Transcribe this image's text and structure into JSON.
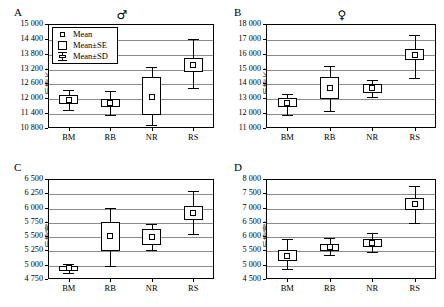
{
  "figure": {
    "panels": [
      "A",
      "B",
      "C",
      "D"
    ],
    "legend": {
      "mean_label": "Mean",
      "se_label": "Mean±SE",
      "sd_label": "Mean±SD"
    }
  },
  "chart_data": [
    {
      "panel": "A",
      "type": "box",
      "title": "A",
      "sex_symbol": "♂",
      "ylabel": "后翅长/mm",
      "xlabel": "",
      "categories": [
        "BM",
        "RB",
        "NR",
        "RS"
      ],
      "ylim": [
        10800,
        15000
      ],
      "yticks": [
        "10 800",
        "11 400",
        "12 000",
        "12 600",
        "13 200",
        "13 800",
        "14 400",
        "15 000"
      ],
      "ytick_values": [
        10800,
        11400,
        12000,
        12600,
        13200,
        13800,
        14400,
        15000
      ],
      "grid": true,
      "legend_position": "upper-left",
      "series": [
        {
          "name": "BM",
          "mean": 11930,
          "se_low": 11760,
          "se_high": 12120,
          "sd_low": 11530,
          "sd_high": 12330
        },
        {
          "name": "RB",
          "mean": 11800,
          "se_low": 11650,
          "se_high": 11960,
          "sd_low": 11330,
          "sd_high": 12280
        },
        {
          "name": "NR",
          "mean": 12070,
          "se_low": 11330,
          "se_high": 12840,
          "sd_low": 10910,
          "sd_high": 13270
        },
        {
          "name": "RS",
          "mean": 13360,
          "se_low": 13080,
          "se_high": 13640,
          "sd_low": 12400,
          "sd_high": 14400
        }
      ]
    },
    {
      "panel": "B",
      "type": "box",
      "title": "B",
      "sex_symbol": "♀",
      "ylabel": "后翅长/mm",
      "xlabel": "",
      "categories": [
        "BM",
        "RB",
        "NR",
        "RS"
      ],
      "ylim": [
        11000,
        18000
      ],
      "yticks": [
        "11 000",
        "12 000",
        "13 000",
        "14 000",
        "15 000",
        "16 000",
        "17 000",
        "18 000"
      ],
      "ytick_values": [
        11000,
        12000,
        13000,
        14000,
        15000,
        16000,
        17000,
        18000
      ],
      "grid": true,
      "legend_position": "none",
      "series": [
        {
          "name": "BM",
          "mean": 12700,
          "se_low": 12400,
          "se_high": 13000,
          "sd_low": 11900,
          "sd_high": 13300
        },
        {
          "name": "RB",
          "mean": 13680,
          "se_low": 12950,
          "se_high": 14450,
          "sd_low": 12130,
          "sd_high": 15200
        },
        {
          "name": "NR",
          "mean": 13660,
          "se_low": 13350,
          "se_high": 13950,
          "sd_low": 13100,
          "sd_high": 14200
        },
        {
          "name": "RS",
          "mean": 15930,
          "se_low": 15550,
          "se_high": 16300,
          "sd_low": 14380,
          "sd_high": 17280
        }
      ]
    },
    {
      "panel": "C",
      "type": "box",
      "title": "C",
      "sex_symbol": "",
      "ylabel": "后翅宽/mm",
      "xlabel": "",
      "categories": [
        "BM",
        "RB",
        "NR",
        "RS"
      ],
      "ylim": [
        4750,
        6500
      ],
      "yticks": [
        "4 750",
        "5 000",
        "5 250",
        "5 500",
        "5 750",
        "6 000",
        "6 250",
        "6 500"
      ],
      "ytick_values": [
        4750,
        5000,
        5250,
        5500,
        5750,
        6000,
        6250,
        6500
      ],
      "grid": true,
      "legend_position": "none",
      "series": [
        {
          "name": "BM",
          "mean": 4935,
          "se_low": 4895,
          "se_high": 4975,
          "sd_low": 4855,
          "sd_high": 5010
        },
        {
          "name": "RB",
          "mean": 5495,
          "se_low": 5240,
          "se_high": 5745,
          "sd_low": 4985,
          "sd_high": 6000
        },
        {
          "name": "NR",
          "mean": 5480,
          "se_low": 5350,
          "se_high": 5630,
          "sd_low": 5265,
          "sd_high": 5720
        },
        {
          "name": "RS",
          "mean": 5905,
          "se_low": 5790,
          "se_high": 6030,
          "sd_low": 5530,
          "sd_high": 6290
        }
      ]
    },
    {
      "panel": "D",
      "type": "box",
      "title": "D",
      "sex_symbol": "",
      "ylabel": "后翅宽/mm",
      "xlabel": "",
      "categories": [
        "BM",
        "RB",
        "NR",
        "RS"
      ],
      "ylim": [
        4500,
        8000
      ],
      "yticks": [
        "4 500",
        "5 000",
        "5 500",
        "6 000",
        "6 500",
        "7 000",
        "7 500",
        "8 000"
      ],
      "ytick_values": [
        4500,
        5000,
        5500,
        6000,
        6500,
        7000,
        7500,
        8000
      ],
      "grid": true,
      "legend_position": "none",
      "series": [
        {
          "name": "BM",
          "mean": 5310,
          "se_low": 5130,
          "se_high": 5500,
          "sd_low": 4860,
          "sd_high": 5890
        },
        {
          "name": "RB",
          "mean": 5605,
          "se_low": 5480,
          "se_high": 5740,
          "sd_low": 5340,
          "sd_high": 5950
        },
        {
          "name": "NR",
          "mean": 5755,
          "se_low": 5610,
          "se_high": 5905,
          "sd_low": 5430,
          "sd_high": 6100
        },
        {
          "name": "RS",
          "mean": 7110,
          "se_low": 6930,
          "se_high": 7320,
          "sd_low": 6470,
          "sd_high": 7740
        }
      ]
    }
  ]
}
